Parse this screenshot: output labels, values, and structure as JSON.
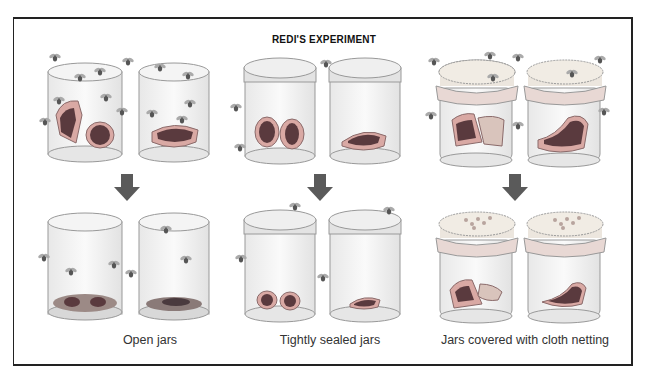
{
  "title": "REDI'S EXPERIMENT",
  "groups": [
    {
      "id": "open",
      "caption": "Open jars",
      "before": "meat exposed, flies entering",
      "after": "maggots on meat"
    },
    {
      "id": "sealed",
      "caption": "Tightly sealed jars",
      "before": "meat sealed, flies outside",
      "after": "no maggots"
    },
    {
      "id": "netting",
      "caption": "Jars covered with cloth netting",
      "before": "meat covered by netting, flies outside",
      "after": "eggs/maggots on netting only"
    }
  ],
  "colors": {
    "border": "#222222",
    "arrow": "#5a5a5a",
    "meat_dark": "#5a3a3e",
    "meat_light": "#d9a9a4",
    "glass": "#ececec",
    "lid": "#e3e3e3"
  }
}
